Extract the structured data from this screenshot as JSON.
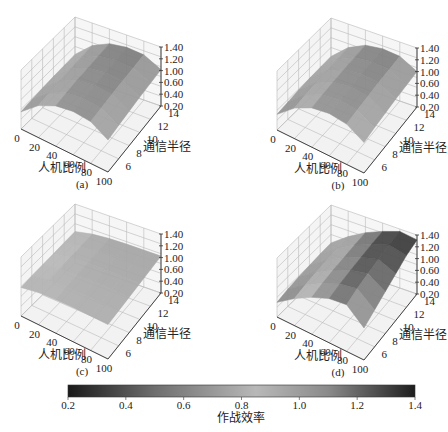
{
  "chart_data": {
    "type": "surface3d",
    "panels": [
      {
        "id": "a",
        "caption": "(a)",
        "xlabel": "人机比例",
        "ylabel": "通信半径",
        "zlabel": "",
        "x_ticks": [
          "0",
          "20",
          "40",
          "60",
          "80",
          "100"
        ],
        "y_ticks": [
          "6",
          "8",
          "10",
          "12",
          "14"
        ],
        "z_ticks": [
          "1.40",
          "1.20",
          "1.00",
          "0.60",
          "0.40",
          "0.20"
        ],
        "xlim": [
          0,
          100
        ],
        "ylim": [
          4,
          14
        ],
        "zlim": [
          0.2,
          1.4
        ],
        "x": [
          0,
          20,
          40,
          60,
          80,
          100
        ],
        "y": [
          4,
          6,
          8,
          10,
          12,
          14
        ],
        "z": [
          [
            0.55,
            0.85,
            1.02,
            1.08,
            1.05,
            0.85
          ],
          [
            0.58,
            0.88,
            1.05,
            1.1,
            1.07,
            0.88
          ],
          [
            0.6,
            0.9,
            1.07,
            1.12,
            1.09,
            0.9
          ],
          [
            0.62,
            0.92,
            1.08,
            1.13,
            1.1,
            0.92
          ],
          [
            0.63,
            0.93,
            1.09,
            1.14,
            1.11,
            0.93
          ],
          [
            0.64,
            0.94,
            1.1,
            1.15,
            1.12,
            0.94
          ]
        ]
      },
      {
        "id": "b",
        "caption": "(b)",
        "xlabel": "人机比例",
        "ylabel": "通信半径",
        "zlabel": "",
        "x_ticks": [
          "0",
          "20",
          "40",
          "60",
          "80",
          "100"
        ],
        "y_ticks": [
          "6",
          "8",
          "10",
          "12",
          "14"
        ],
        "z_ticks": [
          "1.40",
          "1.20",
          "1.00",
          "0.60",
          "0.40",
          "0.20"
        ],
        "xlim": [
          0,
          100
        ],
        "ylim": [
          4,
          14
        ],
        "zlim": [
          0.2,
          1.4
        ],
        "x": [
          0,
          20,
          40,
          60,
          80,
          100
        ],
        "y": [
          4,
          6,
          8,
          10,
          12,
          14
        ],
        "z": [
          [
            0.52,
            0.82,
            1.0,
            1.06,
            1.02,
            0.82
          ],
          [
            0.55,
            0.86,
            1.03,
            1.09,
            1.05,
            0.86
          ],
          [
            0.58,
            0.88,
            1.05,
            1.11,
            1.07,
            0.88
          ],
          [
            0.6,
            0.9,
            1.07,
            1.12,
            1.09,
            0.9
          ],
          [
            0.61,
            0.91,
            1.08,
            1.13,
            1.1,
            0.91
          ],
          [
            0.62,
            0.92,
            1.09,
            1.14,
            1.11,
            0.92
          ]
        ]
      },
      {
        "id": "c",
        "caption": "(c)",
        "xlabel": "人机比例",
        "ylabel": "通信半径",
        "zlabel": "",
        "x_ticks": [
          "0",
          "20",
          "40",
          "60",
          "80",
          "100"
        ],
        "y_ticks": [
          "6",
          "8",
          "10",
          "12",
          "14"
        ],
        "z_ticks": [
          "1.40",
          "1.20",
          "1.00",
          "0.60",
          "0.40",
          "0.20"
        ],
        "xlim": [
          0,
          100
        ],
        "ylim": [
          4,
          14
        ],
        "zlim": [
          0.2,
          1.4
        ],
        "x": [
          0,
          20,
          40,
          60,
          80,
          100
        ],
        "y": [
          4,
          6,
          8,
          10,
          12,
          14
        ],
        "z": [
          [
            0.78,
            0.85,
            0.88,
            0.9,
            0.9,
            0.9
          ],
          [
            0.8,
            0.87,
            0.9,
            0.91,
            0.91,
            0.91
          ],
          [
            0.81,
            0.88,
            0.91,
            0.92,
            0.92,
            0.92
          ],
          [
            0.82,
            0.89,
            0.92,
            0.93,
            0.93,
            0.93
          ],
          [
            0.83,
            0.9,
            0.93,
            0.94,
            0.94,
            0.94
          ],
          [
            0.84,
            0.91,
            0.94,
            0.95,
            0.95,
            0.95
          ]
        ]
      },
      {
        "id": "d",
        "caption": "(d)",
        "xlabel": "人机比例",
        "ylabel": "通信半径",
        "zlabel": "",
        "x_ticks": [
          "0",
          "20",
          "40",
          "60",
          "80",
          "100"
        ],
        "y_ticks": [
          "6",
          "8",
          "10",
          "12",
          "14"
        ],
        "z_ticks": [
          "1.40",
          "1.20",
          "1.00",
          "0.60",
          "0.40",
          "0.20"
        ],
        "xlim": [
          0,
          100
        ],
        "ylim": [
          4,
          14
        ],
        "zlim": [
          0.2,
          1.4
        ],
        "x": [
          0,
          20,
          40,
          60,
          80,
          100
        ],
        "y": [
          4,
          6,
          8,
          10,
          12,
          14
        ],
        "z": [
          [
            0.5,
            0.75,
            0.95,
            1.1,
            1.15,
            0.85
          ],
          [
            0.55,
            0.8,
            1.0,
            1.15,
            1.22,
            0.95
          ],
          [
            0.58,
            0.83,
            1.03,
            1.18,
            1.27,
            1.05
          ],
          [
            0.6,
            0.85,
            1.05,
            1.2,
            1.3,
            1.15
          ],
          [
            0.62,
            0.87,
            1.07,
            1.22,
            1.33,
            1.25
          ],
          [
            0.63,
            0.88,
            1.08,
            1.23,
            1.35,
            1.3
          ]
        ]
      }
    ],
    "colorbar": {
      "label": "作战效率",
      "ticks": [
        "0.2",
        "0.4",
        "0.6",
        "0.8",
        "1.0",
        "1.2",
        "1.4"
      ],
      "range": [
        0.2,
        1.4
      ],
      "orientation": "horizontal",
      "colormap_stops": [
        {
          "v": 0.2,
          "color": "#1a1a1a"
        },
        {
          "v": 0.5,
          "color": "#6e6e6e"
        },
        {
          "v": 0.85,
          "color": "#b8b8b8"
        },
        {
          "v": 1.1,
          "color": "#8a8a8a"
        },
        {
          "v": 1.4,
          "color": "#1e1e1e"
        }
      ]
    }
  }
}
